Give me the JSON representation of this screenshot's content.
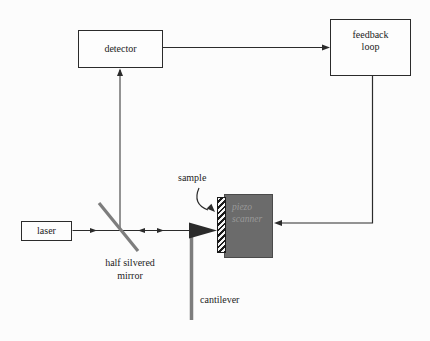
{
  "diagram": {
    "boxes": {
      "detector": {
        "label": "detector"
      },
      "feedback_loop": {
        "line1": "feedback",
        "line2": "loop"
      },
      "laser": {
        "label": "laser"
      },
      "piezo_scanner": {
        "line1": "piezo",
        "line2": "scanner"
      }
    },
    "annotations": {
      "sample": "sample",
      "mirror_line1": "half silvered",
      "mirror_line2": "mirror",
      "cantilever": "cantilever"
    },
    "colors": {
      "background": "#fcfcfc",
      "line": "#2b2b2b",
      "box_border": "#2b2b2b",
      "box_fill": "#fdfdfd",
      "piezo_fill": "#6b6b6b",
      "piezo_border": "#4a4a4a",
      "piezo_text": "#999999",
      "gray_part": "#7d7d7d",
      "text": "#1c1c1c"
    }
  }
}
